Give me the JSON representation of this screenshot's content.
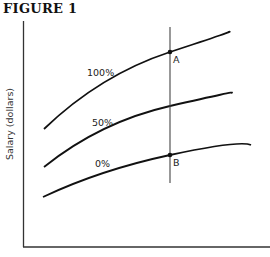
{
  "figure": {
    "title": "FIGURE 1",
    "y_axis_label": "Salary (dollars)",
    "x_axis_label": ""
  },
  "curves": [
    {
      "label": "100%",
      "color": "#111111"
    },
    {
      "label": "50%",
      "color": "#111111"
    },
    {
      "label": "0%",
      "color": "#111111"
    }
  ],
  "points": [
    {
      "label": "A",
      "on_curve": "100%"
    },
    {
      "label": "B",
      "on_curve": "0%"
    }
  ]
}
